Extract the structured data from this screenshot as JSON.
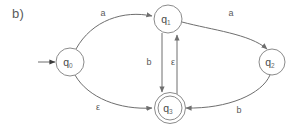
{
  "figure": {
    "label": "b)",
    "caption_color": "#5a5a5a"
  },
  "diagram": {
    "type": "finite-state-automaton",
    "stroke_color": "#6e6e6e",
    "node_stroke_color": "#8b8b8b",
    "background": "#ffffff",
    "start_state": "q0",
    "accepting_states": [
      "q3"
    ],
    "states": [
      {
        "id": "q0",
        "base": "q",
        "sub": "0",
        "cx": 70,
        "cy": 62,
        "r": 14,
        "accepting": false,
        "start": true
      },
      {
        "id": "q1",
        "base": "q",
        "sub": "1",
        "cx": 168,
        "cy": 19,
        "r": 14,
        "accepting": false,
        "start": false
      },
      {
        "id": "q2",
        "base": "q",
        "sub": "2",
        "cx": 272,
        "cy": 62,
        "r": 13,
        "accepting": false,
        "start": false
      },
      {
        "id": "q3",
        "base": "q",
        "sub": "3",
        "cx": 170,
        "cy": 108,
        "r": 13,
        "accepting": true,
        "start": false
      }
    ],
    "transitions": [
      {
        "id": "t-q0-q1",
        "from": "q0",
        "to": "q1",
        "symbol": "a",
        "label_x": 103,
        "label_y": 13
      },
      {
        "id": "t-q1-q2",
        "from": "q1",
        "to": "q2",
        "symbol": "a",
        "label_x": 231,
        "label_y": 13
      },
      {
        "id": "t-q1-q3",
        "from": "q1",
        "to": "q3",
        "symbol": "b",
        "label_x": 149,
        "label_y": 62
      },
      {
        "id": "t-q3-q1",
        "from": "q3",
        "to": "q1",
        "symbol": "ε",
        "label_x": 173,
        "label_y": 62
      },
      {
        "id": "t-q0-q3",
        "from": "q0",
        "to": "q3",
        "symbol": "ε",
        "label_x": 98,
        "label_y": 107
      },
      {
        "id": "t-q2-q3",
        "from": "q2",
        "to": "q3",
        "symbol": "b",
        "label_x": 239,
        "label_y": 110
      }
    ],
    "start_arrow": {
      "x1": 38,
      "y1": 62,
      "x2": 55,
      "y2": 62
    }
  }
}
